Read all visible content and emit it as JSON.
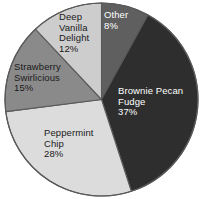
{
  "chart_data": {
    "type": "pie",
    "title": "",
    "subtitle": "",
    "xlabel": "",
    "ylabel": "",
    "legend_position": "none",
    "labels_inside_slices": true,
    "start_angle_deg": 0,
    "direction": "clockwise",
    "units": "percent",
    "categories": [
      "Other",
      "Brownie Pecan Fudge",
      "Peppermint Chip",
      "Strawberry Swirlicious",
      "Deep Vanilla Delight"
    ],
    "values": [
      8,
      37,
      28,
      15,
      12
    ],
    "slices": [
      {
        "name": "Other",
        "value": 8,
        "value_label": "8%",
        "color": "#5f5f5f",
        "text_color": "#ffffff",
        "name_lines": [
          "Other"
        ]
      },
      {
        "name": "Brownie Pecan Fudge",
        "value": 37,
        "value_label": "37%",
        "color": "#2e2e2e",
        "text_color": "#ffffff",
        "name_lines": [
          "Brownie Pecan",
          "Fudge"
        ]
      },
      {
        "name": "Peppermint Chip",
        "value": 28,
        "value_label": "28%",
        "color": "#dcdcdc",
        "text_color": "#1a1a1a",
        "name_lines": [
          "Peppermint",
          "Chip"
        ]
      },
      {
        "name": "Strawberry Swirlicious",
        "value": 15,
        "value_label": "15%",
        "color": "#8a8a8a",
        "text_color": "#1a1a1a",
        "name_lines": [
          "Strawberry",
          "Swirlicious"
        ]
      },
      {
        "name": "Deep Vanilla Delight",
        "value": 12,
        "value_label": "12%",
        "color": "#cdcdcd",
        "text_color": "#1a1a1a",
        "name_lines": [
          "Deep",
          "Vanilla",
          "Delight"
        ]
      }
    ],
    "background_color": "#ffffff",
    "outline_color": "#5a5a5a"
  }
}
